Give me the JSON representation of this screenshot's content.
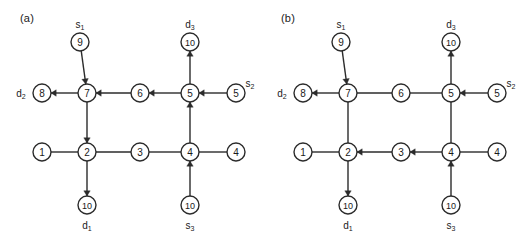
{
  "figure": {
    "width": 522,
    "height": 239,
    "background": "#ffffff",
    "stroke_color": "#2b2b2b",
    "text_color": "#1a1a1a"
  },
  "panels": [
    {
      "id": "a",
      "label": "(a)",
      "nodes": [
        {
          "id": "n9",
          "value": "9",
          "x": 80,
          "y": 42,
          "ext_label": "s1",
          "ext_label_base": "s",
          "ext_label_sub": "1",
          "ext_pos": "top"
        },
        {
          "id": "n8",
          "value": "8",
          "x": 42,
          "y": 93,
          "ext_label": "d2",
          "ext_label_base": "d",
          "ext_label_sub": "2",
          "ext_pos": "left"
        },
        {
          "id": "n7",
          "value": "7",
          "x": 87,
          "y": 93,
          "ext_label": "",
          "ext_label_base": "",
          "ext_label_sub": "",
          "ext_pos": ""
        },
        {
          "id": "n6",
          "value": "6",
          "x": 140,
          "y": 93,
          "ext_label": "",
          "ext_label_base": "",
          "ext_label_sub": "",
          "ext_pos": ""
        },
        {
          "id": "n5",
          "value": "5",
          "x": 190,
          "y": 93,
          "ext_label": "",
          "ext_label_base": "",
          "ext_label_sub": "",
          "ext_pos": ""
        },
        {
          "id": "n5s",
          "value": "5",
          "x": 236,
          "y": 93,
          "ext_label": "s2",
          "ext_label_base": "s",
          "ext_label_sub": "2",
          "ext_pos": "topright"
        },
        {
          "id": "n10d3",
          "value": "10",
          "x": 190,
          "y": 42,
          "ext_label": "d3",
          "ext_label_base": "d",
          "ext_label_sub": "3",
          "ext_pos": "top"
        },
        {
          "id": "n1",
          "value": "1",
          "x": 42,
          "y": 152,
          "ext_label": "",
          "ext_label_base": "",
          "ext_label_sub": "",
          "ext_pos": ""
        },
        {
          "id": "n2",
          "value": "2",
          "x": 87,
          "y": 152,
          "ext_label": "",
          "ext_label_base": "",
          "ext_label_sub": "",
          "ext_pos": ""
        },
        {
          "id": "n3",
          "value": "3",
          "x": 140,
          "y": 152,
          "ext_label": "",
          "ext_label_base": "",
          "ext_label_sub": "",
          "ext_pos": ""
        },
        {
          "id": "n4",
          "value": "4",
          "x": 190,
          "y": 152,
          "ext_label": "",
          "ext_label_base": "",
          "ext_label_sub": "",
          "ext_pos": ""
        },
        {
          "id": "n4r",
          "value": "4",
          "x": 236,
          "y": 152,
          "ext_label": "",
          "ext_label_base": "",
          "ext_label_sub": "",
          "ext_pos": ""
        },
        {
          "id": "n10d1",
          "value": "10",
          "x": 87,
          "y": 205,
          "ext_label": "d1",
          "ext_label_base": "d",
          "ext_label_sub": "1",
          "ext_pos": "bottom"
        },
        {
          "id": "n10s3",
          "value": "10",
          "x": 190,
          "y": 205,
          "ext_label": "s3",
          "ext_label_base": "s",
          "ext_label_sub": "3",
          "ext_pos": "bottom"
        }
      ],
      "edges": [
        {
          "from": "n9",
          "to": "n7",
          "arrow": true
        },
        {
          "from": "n7",
          "to": "n8",
          "arrow": true
        },
        {
          "from": "n5",
          "to": "n6",
          "arrow": true
        },
        {
          "from": "n6",
          "to": "n7",
          "arrow": true
        },
        {
          "from": "n5s",
          "to": "n5",
          "arrow": true
        },
        {
          "from": "n5",
          "to": "n10d3",
          "arrow": true
        },
        {
          "from": "n4",
          "to": "n5",
          "arrow": true
        },
        {
          "from": "n7",
          "to": "n2",
          "arrow": true
        },
        {
          "from": "n1",
          "to": "n2",
          "arrow": false
        },
        {
          "from": "n2",
          "to": "n3",
          "arrow": false
        },
        {
          "from": "n3",
          "to": "n4",
          "arrow": false
        },
        {
          "from": "n4",
          "to": "n4r",
          "arrow": false
        },
        {
          "from": "n2",
          "to": "n10d1",
          "arrow": true
        },
        {
          "from": "n10s3",
          "to": "n4",
          "arrow": true
        }
      ]
    },
    {
      "id": "b",
      "label": "(b)",
      "nodes": [
        {
          "id": "n9",
          "value": "9",
          "x": 80,
          "y": 42,
          "ext_label": "s1",
          "ext_label_base": "s",
          "ext_label_sub": "1",
          "ext_pos": "top"
        },
        {
          "id": "n8",
          "value": "8",
          "x": 42,
          "y": 93,
          "ext_label": "d2",
          "ext_label_base": "d",
          "ext_label_sub": "2",
          "ext_pos": "left"
        },
        {
          "id": "n7",
          "value": "7",
          "x": 87,
          "y": 93,
          "ext_label": "",
          "ext_label_base": "",
          "ext_label_sub": "",
          "ext_pos": ""
        },
        {
          "id": "n6",
          "value": "6",
          "x": 140,
          "y": 93,
          "ext_label": "",
          "ext_label_base": "",
          "ext_label_sub": "",
          "ext_pos": ""
        },
        {
          "id": "n5",
          "value": "5",
          "x": 190,
          "y": 93,
          "ext_label": "",
          "ext_label_base": "",
          "ext_label_sub": "",
          "ext_pos": ""
        },
        {
          "id": "n5s",
          "value": "5",
          "x": 236,
          "y": 93,
          "ext_label": "s2",
          "ext_label_base": "s",
          "ext_label_sub": "2",
          "ext_pos": "topright"
        },
        {
          "id": "n10d3",
          "value": "10",
          "x": 190,
          "y": 42,
          "ext_label": "d3",
          "ext_label_base": "d",
          "ext_label_sub": "3",
          "ext_pos": "top"
        },
        {
          "id": "n1",
          "value": "1",
          "x": 42,
          "y": 152,
          "ext_label": "",
          "ext_label_base": "",
          "ext_label_sub": "",
          "ext_pos": ""
        },
        {
          "id": "n2",
          "value": "2",
          "x": 87,
          "y": 152,
          "ext_label": "",
          "ext_label_base": "",
          "ext_label_sub": "",
          "ext_pos": ""
        },
        {
          "id": "n3",
          "value": "3",
          "x": 140,
          "y": 152,
          "ext_label": "",
          "ext_label_base": "",
          "ext_label_sub": "",
          "ext_pos": ""
        },
        {
          "id": "n4",
          "value": "4",
          "x": 190,
          "y": 152,
          "ext_label": "",
          "ext_label_base": "",
          "ext_label_sub": "",
          "ext_pos": ""
        },
        {
          "id": "n4r",
          "value": "4",
          "x": 236,
          "y": 152,
          "ext_label": "",
          "ext_label_base": "",
          "ext_label_sub": "",
          "ext_pos": ""
        },
        {
          "id": "n10d1",
          "value": "10",
          "x": 87,
          "y": 205,
          "ext_label": "d1",
          "ext_label_base": "d",
          "ext_label_sub": "1",
          "ext_pos": "bottom"
        },
        {
          "id": "n10s3",
          "value": "10",
          "x": 190,
          "y": 205,
          "ext_label": "s3",
          "ext_label_base": "s",
          "ext_label_sub": "3",
          "ext_pos": "bottom"
        }
      ],
      "edges": [
        {
          "from": "n9",
          "to": "n7",
          "arrow": true
        },
        {
          "from": "n7",
          "to": "n8",
          "arrow": true
        },
        {
          "from": "n7",
          "to": "n6",
          "arrow": false
        },
        {
          "from": "n6",
          "to": "n5",
          "arrow": false
        },
        {
          "from": "n5s",
          "to": "n5",
          "arrow": true
        },
        {
          "from": "n5",
          "to": "n10d3",
          "arrow": true
        },
        {
          "from": "n4",
          "to": "n5",
          "arrow": false
        },
        {
          "from": "n7",
          "to": "n2",
          "arrow": false
        },
        {
          "from": "n1",
          "to": "n2",
          "arrow": false
        },
        {
          "from": "n3",
          "to": "n2",
          "arrow": true
        },
        {
          "from": "n4",
          "to": "n3",
          "arrow": true
        },
        {
          "from": "n4",
          "to": "n4r",
          "arrow": false
        },
        {
          "from": "n2",
          "to": "n10d1",
          "arrow": true
        },
        {
          "from": "n10s3",
          "to": "n4",
          "arrow": true
        }
      ]
    }
  ]
}
